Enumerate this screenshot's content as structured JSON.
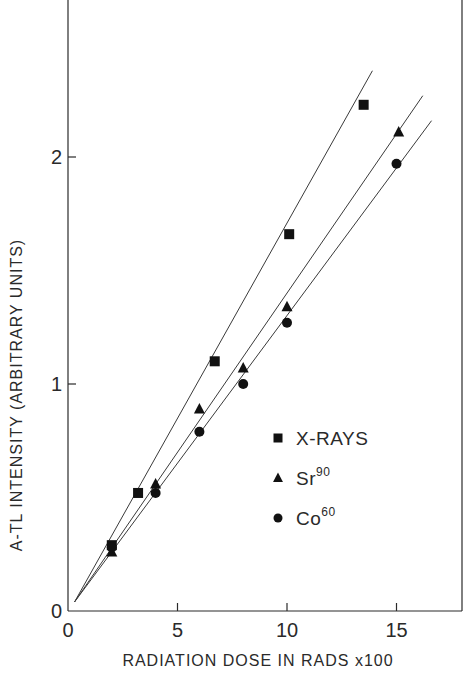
{
  "chart_data": {
    "type": "scatter",
    "title": "",
    "xlabel": "RADIATION DOSE IN RADS x100",
    "ylabel": "A-TL INTENSITY (ARBITRARY UNITS)",
    "xlim": [
      0,
      18
    ],
    "ylim": [
      0,
      2.6
    ],
    "x_ticks": [
      0,
      5,
      10,
      15
    ],
    "x_tick_labels": [
      "0",
      "5",
      "10",
      "15"
    ],
    "y_ticks": [
      0,
      1,
      2
    ],
    "y_tick_labels": [
      "0",
      "1",
      "2"
    ],
    "grid": false,
    "legend_position": "lower-right (inside plot)",
    "fit_lines_note": "straight lines drawn through each series from near origin; endpoints estimated visually",
    "series": [
      {
        "name": "X-RAYS",
        "legend_label": "X-RAYS",
        "legend_sup": "",
        "marker": "square",
        "x": [
          2.0,
          3.2,
          6.7,
          10.1,
          13.5
        ],
        "y": [
          0.29,
          0.52,
          1.1,
          1.66,
          2.23
        ],
        "fit_line_endpoints": [
          [
            0.3,
            0.04
          ],
          [
            13.9,
            2.38
          ]
        ]
      },
      {
        "name": "Sr90",
        "legend_label": "Sr",
        "legend_sup": "90",
        "marker": "triangle",
        "x": [
          2.0,
          4.0,
          6.0,
          8.0,
          10.0,
          15.1
        ],
        "y": [
          0.26,
          0.56,
          0.89,
          1.07,
          1.34,
          2.11
        ],
        "fit_line_endpoints": [
          [
            0.3,
            0.04
          ],
          [
            16.2,
            2.27
          ]
        ]
      },
      {
        "name": "Co60",
        "legend_label": "Co",
        "legend_sup": "60",
        "marker": "circle",
        "x": [
          2.0,
          4.0,
          6.0,
          8.0,
          10.0,
          15.0
        ],
        "y": [
          0.28,
          0.52,
          0.79,
          1.0,
          1.27,
          1.97
        ],
        "fit_line_endpoints": [
          [
            0.3,
            0.04
          ],
          [
            16.6,
            2.16
          ]
        ]
      }
    ]
  },
  "layout": {
    "plot_px": {
      "x0": 68,
      "y0": 611,
      "x_unit": 21.9,
      "y_unit": 227,
      "right": 462,
      "top": 0
    },
    "ylabel_center": [
      22,
      395
    ],
    "xlabel_pos": [
      258,
      666
    ],
    "legend": {
      "x": 268,
      "y": 438,
      "row_gap": 40
    }
  }
}
